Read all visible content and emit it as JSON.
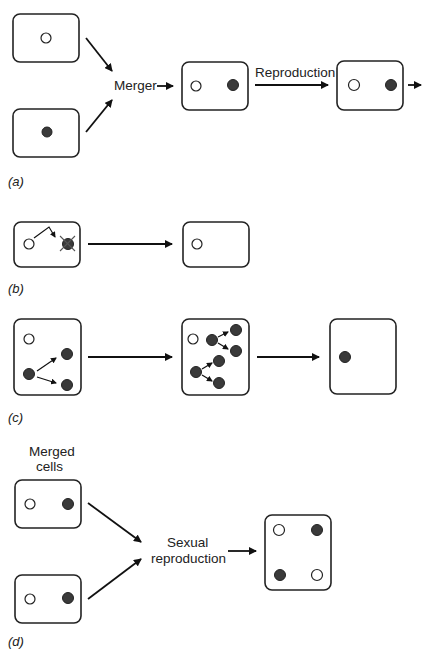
{
  "figure": {
    "panels": [
      {
        "id": "a",
        "label": "(a)",
        "text": {
          "merger": "Merger",
          "reproduction": "Reproduction"
        }
      },
      {
        "id": "b",
        "label": "(b)"
      },
      {
        "id": "c",
        "label": "(c)"
      },
      {
        "id": "d",
        "label": "(d)",
        "text": {
          "merged_line1": "Merged",
          "merged_line2": "cells",
          "sexual_line1": "Sexual",
          "sexual_line2": "reproduction"
        }
      }
    ],
    "colors": {
      "dark_organelle": "#3a3a3a",
      "outline": "#222222",
      "background": "#ffffff"
    }
  }
}
